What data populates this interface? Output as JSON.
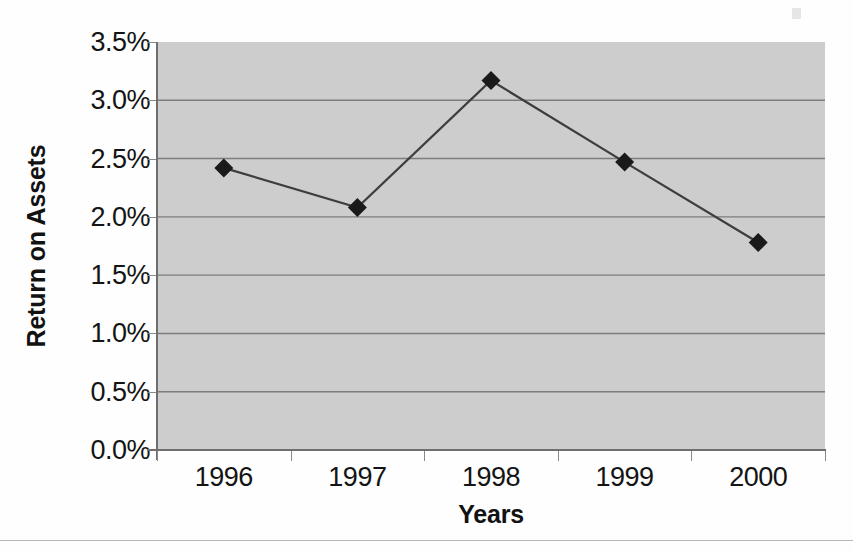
{
  "chart_data": {
    "type": "line",
    "title": "",
    "subtitle": "",
    "xlabel": "Years",
    "ylabel": "Return on Assets",
    "categories": [
      "1996",
      "1997",
      "1998",
      "1999",
      "2000"
    ],
    "values": [
      2.42,
      2.08,
      3.17,
      2.47,
      1.78
    ],
    "series": [
      {
        "name": "Return on Assets",
        "values": [
          2.42,
          2.08,
          3.17,
          2.47,
          1.78
        ]
      }
    ],
    "ytick_labels": [
      "0.0%",
      "0.5%",
      "1.0%",
      "1.5%",
      "2.0%",
      "2.5%",
      "3.0%",
      "3.5%"
    ],
    "ytick_values": [
      0.0,
      0.5,
      1.0,
      1.5,
      2.0,
      2.5,
      3.0,
      3.5
    ],
    "ylim": [
      0.0,
      3.5
    ],
    "ytick_step": 0.5,
    "grid": "horizontal",
    "legend": "none",
    "legend_position": "none",
    "marker": "diamond",
    "marker_color": "#1a1a1a",
    "line_color": "#3d3d3d",
    "plot_background": "#cdcdcd",
    "figure_background": "#fefefe",
    "gridline_color": "#7d7d7d",
    "axis_color": "#6e6e6e",
    "text_color": "#141414",
    "annotations": []
  }
}
